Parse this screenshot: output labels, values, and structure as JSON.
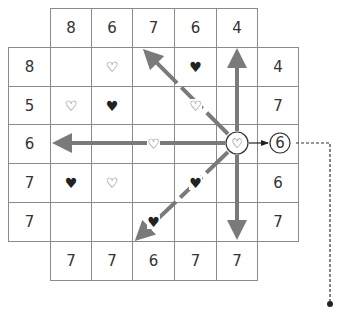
{
  "puzzle": {
    "top_clues": [
      "8",
      "6",
      "7",
      "6",
      "4"
    ],
    "bottom_clues": [
      "7",
      "7",
      "6",
      "7",
      "7"
    ],
    "left_clues": [
      "8",
      "5",
      "6",
      "7",
      "7"
    ],
    "right_clues": [
      "4",
      "7",
      "6",
      "6",
      "7"
    ],
    "grid": [
      [
        "",
        "outline",
        "",
        "filled",
        ""
      ],
      [
        "outline",
        "filled",
        "",
        "outline",
        ""
      ],
      [
        "",
        "",
        "outline",
        "",
        "origin"
      ],
      [
        "filled",
        "outline",
        "",
        "filled",
        ""
      ],
      [
        "",
        "",
        "filled",
        "",
        ""
      ]
    ],
    "symbols": {
      "outline": "♡",
      "filled": "♥",
      "origin": "♡"
    },
    "highlighted_clue": "6",
    "colors": {
      "arrow": "#7a7a7a",
      "grid": "#8a8a8a",
      "text": "#333333"
    }
  }
}
